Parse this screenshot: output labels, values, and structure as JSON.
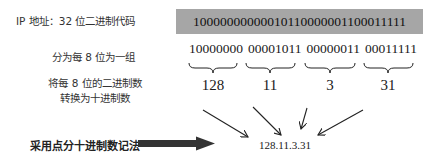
{
  "labels": {
    "ip_address": "IP 地址：32 位二进制代码",
    "split_groups": "分为每 8 位为一组",
    "convert_line1": "将每 8 位的二进制数",
    "convert_line2": "转换为十进制数",
    "dotted_notation": "采用点分十进制数记法"
  },
  "binary_full": "10000000000010110000001100011111",
  "groups": [
    {
      "binary": "10000000",
      "decimal": "128"
    },
    {
      "binary": "00001011",
      "decimal": "11"
    },
    {
      "binary": "00000011",
      "decimal": "3"
    },
    {
      "binary": "00011111",
      "decimal": "31"
    }
  ],
  "result": "128.11.3.31",
  "colors": {
    "binary_box_bg": "#a6a6a6",
    "arrow": "#333333"
  }
}
